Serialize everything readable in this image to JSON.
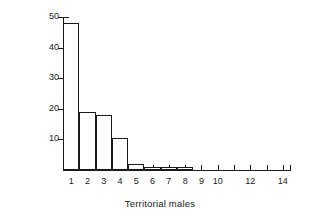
{
  "chart_data": {
    "type": "bar",
    "title": "",
    "xlabel": "Territorial males",
    "ylabel": "% Copulations",
    "categories": [
      "1",
      "2",
      "3",
      "4",
      "5",
      "6",
      "7",
      "8",
      "9",
      "10",
      "11",
      "12",
      "13",
      "14"
    ],
    "values": [
      48,
      19,
      18,
      10.3,
      2,
      1,
      1,
      1,
      0,
      0,
      0,
      0,
      0,
      0
    ],
    "xlim": [
      0.5,
      14.5
    ],
    "ylim": [
      0,
      50
    ],
    "y_ticks": [
      10,
      20,
      30,
      40,
      50
    ],
    "y_tick_labels": [
      "10",
      "20",
      "30",
      "40",
      "50"
    ],
    "x_ticks": [
      1,
      2,
      3,
      4,
      5,
      6,
      7,
      8,
      9,
      10,
      11,
      12,
      13,
      14
    ],
    "x_tick_labels": [
      "1",
      "2",
      "3",
      "4",
      "5",
      "6",
      "7",
      "8",
      "9",
      "10",
      "",
      "12",
      "",
      "14"
    ],
    "grid": false,
    "legend": null,
    "bar_style": "open outline, white fill, black edge",
    "bar_color": "#ffffff",
    "edge_color": "#1a1a1a",
    "background_color": "#ffffff"
  }
}
